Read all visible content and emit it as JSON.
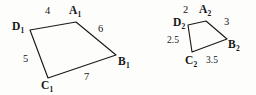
{
  "figure": {
    "caption": "",
    "stroke_color": "#1a1a1a",
    "background_color": "#fdfdfc",
    "text_color": "#161616"
  },
  "shapes": [
    {
      "id": "quadrilateral-1",
      "name": "A1B1C1D1",
      "vertices": [
        {
          "name": "A1",
          "letter": "A",
          "sub": "1",
          "x": 76,
          "y": 22
        },
        {
          "name": "B1",
          "letter": "B",
          "sub": "1",
          "x": 116,
          "y": 55
        },
        {
          "name": "C1",
          "letter": "C",
          "sub": "1",
          "x": 48,
          "y": 78
        },
        {
          "name": "D1",
          "letter": "D",
          "sub": "1",
          "x": 30,
          "y": 30
        }
      ],
      "edges": [
        {
          "from": "D1",
          "to": "A1",
          "length": "4",
          "label_x": 45,
          "label_y": 6
        },
        {
          "from": "A1",
          "to": "B1",
          "length": "6",
          "label_x": 98,
          "label_y": 24
        },
        {
          "from": "D1",
          "to": "C1",
          "length": "5",
          "label_x": 23,
          "label_y": 54
        },
        {
          "from": "C1",
          "to": "B1",
          "length": "7",
          "label_x": 84,
          "label_y": 72
        }
      ],
      "vertex_label_positions": [
        {
          "name": "A1",
          "x": 69,
          "y": 5
        },
        {
          "name": "B1",
          "x": 118,
          "y": 56
        },
        {
          "name": "C1",
          "x": 41,
          "y": 80
        },
        {
          "name": "D1",
          "x": 12,
          "y": 21
        }
      ]
    },
    {
      "id": "quadrilateral-2",
      "name": "A2B2C2D2",
      "vertices": [
        {
          "name": "A2",
          "letter": "A",
          "sub": "2",
          "x": 206,
          "y": 21
        },
        {
          "name": "B2",
          "letter": "B",
          "sub": "2",
          "x": 227,
          "y": 39
        },
        {
          "name": "C2",
          "letter": "C",
          "sub": "2",
          "x": 192,
          "y": 52
        },
        {
          "name": "D2",
          "letter": "D",
          "sub": "2",
          "x": 188,
          "y": 25
        }
      ],
      "edges": [
        {
          "from": "D2",
          "to": "A2",
          "length": "2",
          "label_x": 183,
          "label_y": 5
        },
        {
          "from": "A2",
          "to": "B2",
          "length": "3",
          "label_x": 224,
          "label_y": 17
        },
        {
          "from": "D2",
          "to": "C2",
          "length": "2.5",
          "label_x": 167,
          "label_y": 36
        },
        {
          "from": "C2",
          "to": "B2",
          "length": "3.5",
          "label_x": 206,
          "label_y": 56
        }
      ],
      "vertex_label_positions": [
        {
          "name": "A2",
          "x": 199,
          "y": 4
        },
        {
          "name": "B2",
          "x": 228,
          "y": 39
        },
        {
          "name": "C2",
          "x": 185,
          "y": 55
        },
        {
          "name": "D2",
          "x": 173,
          "y": 17
        }
      ]
    }
  ],
  "labels": {
    "A1": {
      "letter": "A",
      "sub": "1"
    },
    "B1": {
      "letter": "B",
      "sub": "1"
    },
    "C1": {
      "letter": "C",
      "sub": "1"
    },
    "D1": {
      "letter": "D",
      "sub": "1"
    },
    "A2": {
      "letter": "A",
      "sub": "2"
    },
    "B2": {
      "letter": "B",
      "sub": "2"
    },
    "C2": {
      "letter": "C",
      "sub": "2"
    },
    "D2": {
      "letter": "D",
      "sub": "2"
    }
  },
  "lengths": {
    "left_top": "4",
    "left_right": "6",
    "left_left": "5",
    "left_bottom": "7",
    "right_top": "2",
    "right_right": "3",
    "right_left": "2.5",
    "right_bottom": "3.5"
  }
}
